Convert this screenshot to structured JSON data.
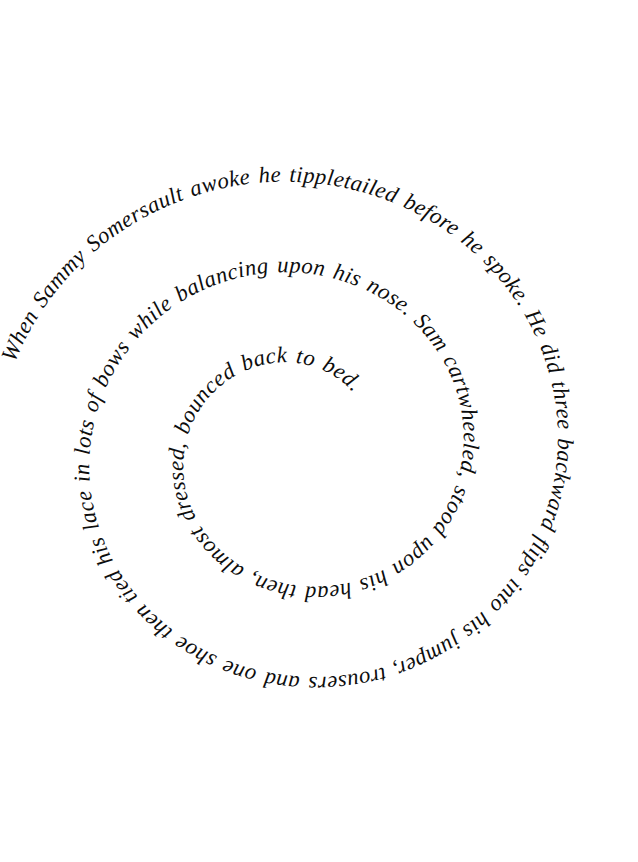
{
  "page": {
    "kind": "spiral-text-illustration",
    "background_color": "#ffffff",
    "text_color": "#0d0d0d",
    "width": 638,
    "height": 862
  },
  "artwork": {
    "title": "Sammy Somersault spiral poem",
    "full_text": "When Sammy Somersault awoke he tippletailed before he spoke. He did three backward flips into his jumper, trousers and one shoe then tied his lace in lots of bows while balancing upon his nose. Sam cartwheeled, stood upon his head then, almost dressed, bounced back to bed.",
    "spiral": {
      "direction": "clockwise-inward",
      "turns": 2.35,
      "center_x": 300,
      "center_y": 452,
      "start_radius": 300,
      "end_radius": 78,
      "start_angle_deg": 198
    },
    "segments": [
      "When Sammy Somersault awoke he tippletailed before he spoke. He did three backward flips into his jumper, trousers and one shoe then tied his lace in lots of bows while balancing upon his nose. Sam cartwheeled, stood upon his head then, almost dressed, bounced back to bed."
    ],
    "phrases": [
      "When Sammy Somersault awoke",
      "he tippletailed before he spoke.",
      "He did three backward flips",
      "into his jumper, trousers and one shoe",
      "then tied his lace in lots of bows",
      "while balancing upon his nose.",
      "Sam cartwheeled, stood upon his head",
      "then, almost dressed, bounced back to bed."
    ]
  }
}
